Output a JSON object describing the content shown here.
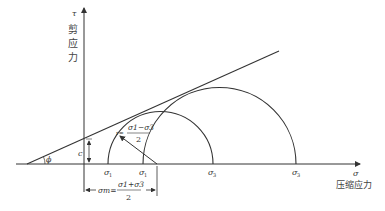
{
  "diagram": {
    "type": "Mohr-Coulomb failure envelope",
    "axes": {
      "y_symbol": "τ",
      "y_label": "剪应力",
      "y_label_chars": [
        "剪",
        "应",
        "力"
      ],
      "x_symbol": "σ",
      "x_label": "压缩应力"
    },
    "circles": [
      {
        "name": "small-mohr-circle",
        "left_label": "σ1",
        "right_label": "σ3"
      },
      {
        "name": "large-mohr-circle",
        "left_label": "σ1",
        "right_label": "σ3"
      }
    ],
    "labels": {
      "sigma": "σ",
      "sub1": "1",
      "sub3": "3",
      "cohesion": "c",
      "friction_angle": "ϕ",
      "radius_numerator": "σ1−σ3",
      "radius_denominator": "2",
      "radius_prefix": "r=",
      "mean_lhs": "σm=",
      "mean_numerator": "σ1+σ3",
      "mean_denominator": "2"
    },
    "colors": {
      "line": "#333333",
      "text": "#333333",
      "background": "#ffffff"
    }
  }
}
